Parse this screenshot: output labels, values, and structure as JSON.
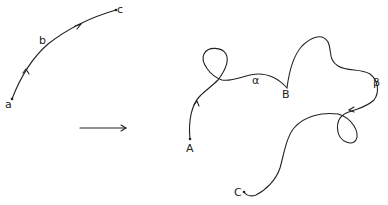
{
  "diagram": {
    "left_path": {
      "labels": {
        "start": "a",
        "middle": "b",
        "end": "c"
      }
    },
    "mapping_arrow": {
      "icon": "right-arrow-icon"
    },
    "right_path": {
      "labels": {
        "start": "A",
        "segment1": "α",
        "middle": "B",
        "segment2": "β",
        "end": "C"
      }
    },
    "colors": {
      "stroke": "#222222",
      "background": "#ffffff"
    }
  }
}
